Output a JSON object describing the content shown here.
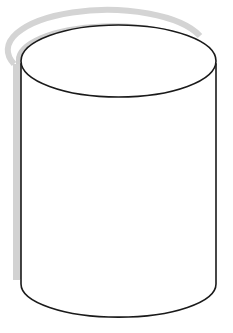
{
  "diagram": {
    "shape": "cylinder",
    "stroke_color": "#1a1a1a",
    "fill_color": "#ffffff",
    "shadow_color": "#c8c8c8"
  }
}
